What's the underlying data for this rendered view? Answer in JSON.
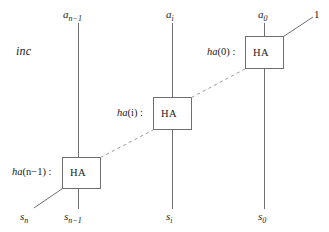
{
  "diagram": {
    "title_label": "inc",
    "stroke_color": "#6e6e72",
    "background_color": "#ffffff",
    "blocks": [
      {
        "id": "ha-n-1",
        "name_prefix": "ha",
        "name_arg": "(n−1)",
        "name_colon": " :",
        "box_label": "HA",
        "input_label": "a",
        "input_sub": "n−1",
        "output_label": "s",
        "output_sub": "n−1",
        "carry_out_label": "s",
        "carry_out_sub": "n"
      },
      {
        "id": "ha-i",
        "name_prefix": "ha",
        "name_arg": "(i)",
        "name_colon": " :",
        "box_label": "HA",
        "input_label": "a",
        "input_sub": "i",
        "output_label": "s",
        "output_sub": "i",
        "carry_out_label": "",
        "carry_out_sub": ""
      },
      {
        "id": "ha-0",
        "name_prefix": "ha",
        "name_arg": "(0)",
        "name_colon": " :",
        "box_label": "HA",
        "input_label": "a",
        "input_sub": "0",
        "output_label": "s",
        "output_sub": "0",
        "carry_in_constant": "1"
      }
    ]
  }
}
